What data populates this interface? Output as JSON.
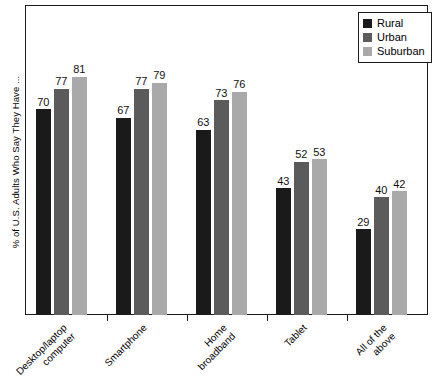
{
  "chart_data": {
    "type": "bar",
    "title": "",
    "subtitle": "",
    "xlabel": "",
    "ylabel": "% of U.S. Adults Who Say They Have ...",
    "categories": [
      "Desktop/laptop\ncomputer",
      "Smartphone",
      "Home\nbroadband",
      "Tablet",
      "All of the\nabove"
    ],
    "series": [
      {
        "name": "Rural",
        "color": "#1a1a1a",
        "values": [
          70,
          67,
          63,
          43,
          29
        ]
      },
      {
        "name": "Urban",
        "color": "#5b5b5b",
        "values": [
          77,
          77,
          73,
          52,
          40
        ]
      },
      {
        "name": "Suburban",
        "color": "#a9a9a9",
        "values": [
          81,
          79,
          76,
          53,
          42
        ]
      }
    ],
    "ylim": [
      0,
      105
    ],
    "grid": false,
    "legend_position": "top-right",
    "value_labels": true
  },
  "legend": {
    "items": [
      {
        "label": "Rural"
      },
      {
        "label": "Urban"
      },
      {
        "label": "Suburban"
      }
    ]
  },
  "axes": {
    "y_title": "% of U.S. Adults Who Say They Have ..."
  }
}
